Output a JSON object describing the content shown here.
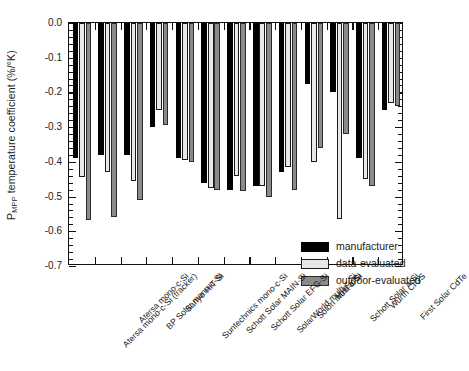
{
  "chart_data": {
    "type": "bar",
    "title": "",
    "xlabel": "",
    "ylabel": "P_MPP temperature coefficient (%/°K)",
    "ylabel_main": "temperature coefficient (%/°K)",
    "ylabel_prefix": "P",
    "ylabel_sub": "MPP",
    "ylim": [
      -0.7,
      0.0
    ],
    "yticks": [
      0.0,
      -0.1,
      -0.2,
      -0.3,
      -0.4,
      -0.5,
      -0.6,
      -0.7
    ],
    "ytick_labels": [
      "0.0",
      "-0.1",
      "-0.2",
      "-0.3",
      "-0.4",
      "-0.5",
      "-0.6",
      "-0.7"
    ],
    "minor_ticks_per_interval": 5,
    "grid": false,
    "legend_position": "lower-right-inside",
    "categories": [
      "Atersa mono-c-Si (tracker)",
      "Atersa mono-c-Si",
      "BP Solar mono-c-Si",
      "Sanyo HIT-Si",
      "Suntechnics mono-c-Si",
      "Schott Solar MAIN-Si",
      "Schott Solar EFG-Si",
      "SolarWorld multi-c-Si",
      "Solon multi-c-Si",
      "MHI a-Si",
      "Schott Solar a-Si",
      "Wurth CIGS",
      "First Solar CdTe"
    ],
    "series": [
      {
        "name": "manufacturer",
        "color": "#000000",
        "values": [
          -0.39,
          -0.38,
          -0.38,
          -0.3,
          -0.39,
          -0.46,
          -0.48,
          -0.47,
          -0.43,
          -0.175,
          -0.2,
          -0.39,
          -0.25
        ]
      },
      {
        "name": "data-evaluated",
        "color": "#e8e8e8",
        "values": [
          -0.445,
          -0.43,
          -0.455,
          -0.25,
          -0.395,
          -0.475,
          -0.44,
          -0.47,
          -0.415,
          -0.4,
          -0.565,
          -0.45,
          -0.23
        ]
      },
      {
        "name": "outdoor-evaluated",
        "color": "#8a8a8a",
        "values": [
          -0.567,
          -0.56,
          -0.51,
          -0.295,
          -0.4,
          -0.48,
          -0.485,
          -0.5,
          -0.48,
          -0.36,
          -0.32,
          -0.47,
          -0.24
        ]
      }
    ]
  },
  "legend": {
    "items": [
      {
        "label": "manufacturer",
        "key": "manufacturer"
      },
      {
        "label": "data-evaluated",
        "key": "data"
      },
      {
        "label": "outdoor-evaluated",
        "key": "outdoor"
      }
    ]
  }
}
